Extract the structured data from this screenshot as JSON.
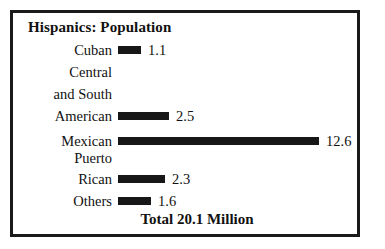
{
  "chart_data": {
    "type": "bar",
    "orientation": "horizontal",
    "title": "Hispanics: Population",
    "xlabel": "",
    "ylabel": "",
    "unit": "Million",
    "grid": false,
    "legend": "none",
    "axis_visible": false,
    "xlim": [
      0,
      12.6
    ],
    "categories": [
      "Cuban",
      "Central and South American",
      "Mexican",
      "Puerto Rican",
      "Others"
    ],
    "values": [
      1.1,
      2.5,
      12.6,
      2.3,
      1.6
    ],
    "value_labels": [
      "1.1",
      "2.5",
      "12.6",
      "2.3",
      "1.6"
    ],
    "annotations": [
      "Total 20.1 Million"
    ]
  },
  "chart": {
    "title": "Hispanics: Population",
    "total": "Total 20.1 Million",
    "bar_color": "#171717",
    "text_color": "#111111",
    "border_color": "#1a1a1a",
    "background": "#ffffff",
    "rows": [
      {
        "label_lines": [
          "Cuban"
        ],
        "label": "Cuban",
        "value": "1.1",
        "bar_px": 23
      },
      {
        "label_lines": [
          "Central",
          "and South",
          "American"
        ],
        "label": "Central and South American",
        "value": "2.5",
        "bar_px": 51
      },
      {
        "label_lines": [
          "Mexican"
        ],
        "label": "Mexican",
        "value": "12.6",
        "bar_px": 201
      },
      {
        "label_lines": [
          "Puerto",
          "Rican"
        ],
        "label": "Puerto Rican",
        "value": "2.3",
        "bar_px": 47
      },
      {
        "label_lines": [
          "Others"
        ],
        "label": "Others",
        "value": "1.6",
        "bar_px": 33
      }
    ]
  }
}
